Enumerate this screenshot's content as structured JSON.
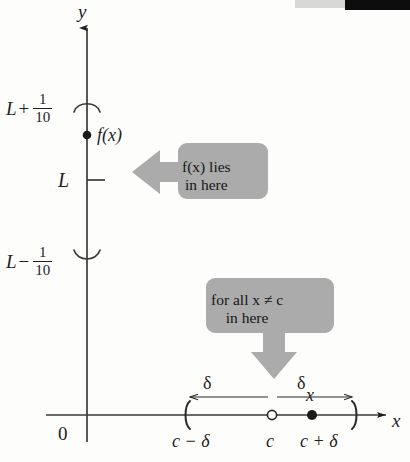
{
  "figure": {
    "axes": {
      "y_label": "y",
      "x_label": "x",
      "origin_label": "0"
    },
    "y_axis_labels": {
      "upper": {
        "base": "L",
        "operator": "+",
        "numerator": "1",
        "denominator": "10"
      },
      "middle": "L",
      "lower": {
        "base": "L",
        "operator": "−",
        "numerator": "1",
        "denominator": "10"
      }
    },
    "points": {
      "fx_label": "f(x)",
      "x_label": "x"
    },
    "x_axis_labels": {
      "left_bracket": "c − δ",
      "center": "c",
      "right_bracket": "c + δ"
    },
    "delta_spans": {
      "left": "δ",
      "right": "δ"
    },
    "callouts": {
      "fx": {
        "line1": "f(x) lies",
        "line2": "in here"
      },
      "all_x": {
        "line1": "for all  x ≠ c",
        "line2": "in here"
      }
    },
    "colors": {
      "ink": "#1e1e1e",
      "callout_fill": "#ababab",
      "background": "#fdfdfc",
      "artifact_gray": "#d8d8d6",
      "artifact_black": "#0d0d0d"
    }
  }
}
